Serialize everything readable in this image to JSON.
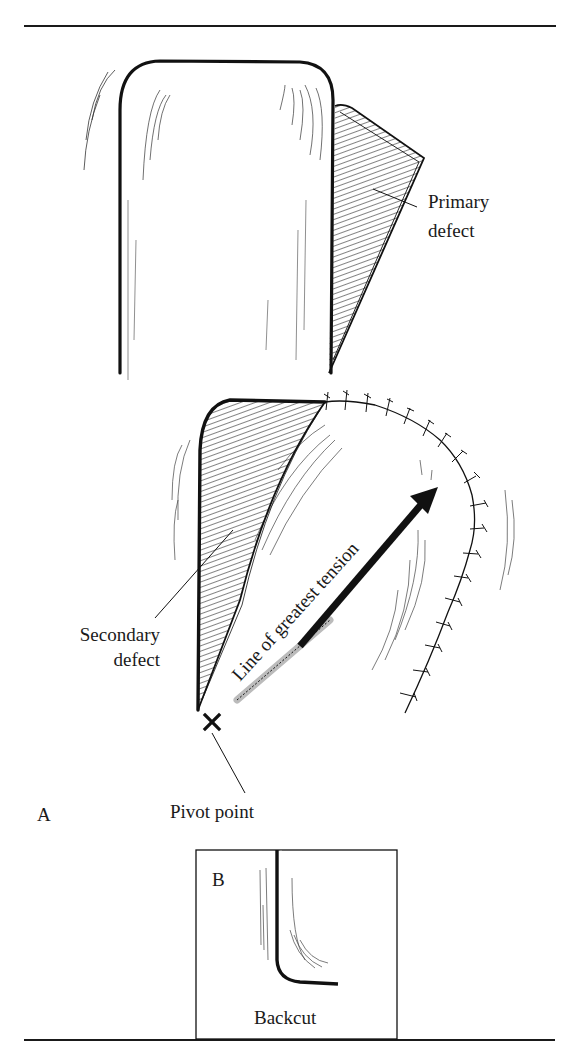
{
  "figure": {
    "panel_a_label": "A",
    "panel_b_label": "B",
    "labels": {
      "primary_defect_line1": "Primary",
      "primary_defect_line2": "defect",
      "secondary_defect_line1": "Secondary",
      "secondary_defect_line2": "defect",
      "line_of_tension": "Line of greatest tension",
      "pivot_point": "Pivot point",
      "backcut": "Backcut"
    },
    "colors": {
      "ink": "#1a1a1a",
      "paper": "#ffffff"
    }
  }
}
